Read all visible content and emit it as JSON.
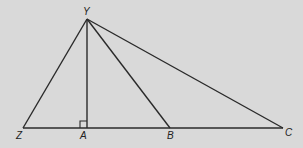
{
  "diagram": {
    "type": "geometry",
    "points": {
      "Y": {
        "label": "Y",
        "x": 87,
        "y": 19,
        "lx": 83,
        "ly": 15
      },
      "Z": {
        "label": "Z",
        "x": 23,
        "y": 128,
        "lx": 16,
        "ly": 139
      },
      "A": {
        "label": "A",
        "x": 87,
        "y": 128,
        "lx": 80,
        "ly": 139
      },
      "B": {
        "label": "B",
        "x": 170,
        "y": 128,
        "lx": 167,
        "ly": 139
      },
      "C": {
        "label": "C",
        "x": 283,
        "y": 128,
        "lx": 285,
        "ly": 136
      }
    },
    "segments": [
      [
        "Z",
        "C"
      ],
      [
        "Y",
        "Z"
      ],
      [
        "Y",
        "A"
      ],
      [
        "Y",
        "B"
      ],
      [
        "Y",
        "C"
      ]
    ],
    "right_angle_at": "A",
    "colors": {
      "background": "#d9d9d9",
      "stroke": "#2a2a2a"
    }
  }
}
